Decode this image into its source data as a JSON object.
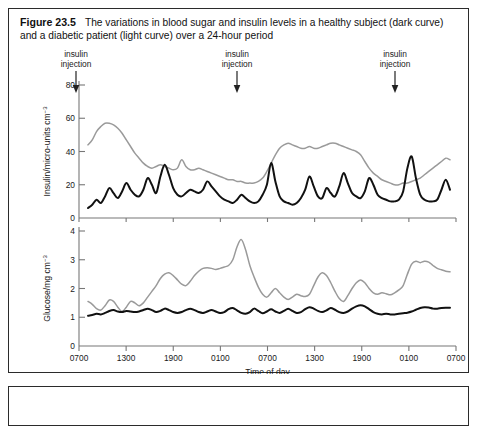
{
  "figure": {
    "number": "Figure 23.5",
    "caption": "The variations in blood sugar and insulin levels in a healthy subject (dark curve) and a diabetic patient (light curve) over a 24-hour period"
  },
  "annotations": {
    "injection_line1": "insulin",
    "injection_line2": "injection",
    "arrow_icon": "down-arrow-icon",
    "positions": [
      75,
      236,
      394
    ]
  },
  "colors": {
    "healthy_curve": "#111111",
    "diabetic_curve": "#9a9a9a",
    "axis": "#777777",
    "border": "#2b2b2b",
    "text": "#1a1a1a"
  },
  "chart_data": [
    {
      "type": "line",
      "title": "Insulin levels over 24 hours",
      "xlabel": "Time of day",
      "ylabel": "Insulin/micro-units cm−3",
      "ylim": [
        0,
        80
      ],
      "yticks": [
        0,
        20,
        40,
        60,
        80
      ],
      "ytick_labels": [
        "0",
        "20",
        "40",
        "60",
        "80"
      ],
      "xtick_labels": [
        "0700",
        "1300",
        "1900",
        "0100",
        "0700",
        "1300",
        "1900",
        "0100",
        "0700"
      ],
      "grid": false,
      "legend": "none",
      "series": [
        {
          "name": "diabetic patient (light curve)",
          "color": "#9a9a9a",
          "values": [
            44,
            47,
            52,
            55,
            57,
            57,
            56,
            54,
            51,
            47,
            43,
            39,
            36,
            33,
            31,
            30,
            31,
            32,
            31,
            30,
            29,
            30,
            35,
            31,
            29,
            29,
            30,
            29,
            28,
            27,
            26,
            25,
            24,
            23,
            23,
            22,
            22,
            21,
            21,
            21,
            22,
            24,
            28,
            33,
            38,
            42,
            44,
            45,
            44,
            43,
            42,
            42,
            43,
            42,
            42,
            43,
            44,
            45,
            45,
            44,
            43,
            42,
            41,
            40,
            38,
            34,
            30,
            27,
            25,
            23,
            22,
            21,
            20,
            20,
            21,
            21,
            22,
            23,
            24,
            26,
            28,
            30,
            32,
            34,
            36,
            35
          ]
        },
        {
          "name": "healthy subject (dark curve)",
          "color": "#111111",
          "values": [
            6,
            8,
            11,
            9,
            13,
            18,
            15,
            12,
            16,
            21,
            17,
            14,
            13,
            17,
            24,
            20,
            15,
            25,
            32,
            26,
            18,
            14,
            13,
            15,
            17,
            16,
            15,
            17,
            22,
            19,
            16,
            13,
            11,
            10,
            9,
            11,
            14,
            12,
            10,
            9,
            10,
            14,
            20,
            33,
            22,
            13,
            10,
            9,
            8,
            9,
            12,
            17,
            25,
            19,
            13,
            12,
            18,
            15,
            13,
            19,
            27,
            21,
            15,
            13,
            12,
            16,
            24,
            20,
            14,
            12,
            11,
            10,
            10,
            11,
            16,
            30,
            37,
            24,
            14,
            11,
            10,
            10,
            11,
            17,
            23,
            17
          ]
        }
      ]
    },
    {
      "type": "line",
      "title": "Blood glucose levels over 24 hours",
      "xlabel": "Time of day",
      "ylabel": "Glucose/mg cm−3",
      "ylim": [
        0,
        4
      ],
      "yticks": [
        0,
        1,
        2,
        3,
        4
      ],
      "ytick_labels": [
        "0",
        "1",
        "2",
        "3",
        "4"
      ],
      "xtick_labels": [
        "0700",
        "1300",
        "1900",
        "0100",
        "0700",
        "1300",
        "1900",
        "0100",
        "0700"
      ],
      "grid": false,
      "legend": "none",
      "series": [
        {
          "name": "diabetic patient (light curve)",
          "color": "#9a9a9a",
          "values": [
            1.55,
            1.45,
            1.3,
            1.25,
            1.4,
            1.6,
            1.55,
            1.35,
            1.2,
            1.35,
            1.55,
            1.5,
            1.4,
            1.5,
            1.7,
            1.9,
            2.1,
            2.35,
            2.5,
            2.55,
            2.45,
            2.3,
            2.15,
            2.1,
            2.25,
            2.45,
            2.6,
            2.7,
            2.72,
            2.7,
            2.66,
            2.7,
            2.75,
            2.8,
            3.0,
            3.45,
            3.7,
            3.35,
            2.8,
            2.4,
            2.05,
            1.8,
            1.7,
            1.85,
            2.0,
            1.85,
            1.7,
            1.62,
            1.7,
            1.8,
            1.75,
            1.72,
            1.8,
            2.1,
            2.4,
            2.55,
            2.45,
            2.2,
            1.9,
            1.65,
            1.55,
            1.75,
            2.0,
            2.2,
            2.3,
            2.2,
            2.0,
            1.85,
            1.8,
            1.85,
            1.82,
            1.78,
            1.85,
            1.95,
            2.1,
            2.5,
            2.85,
            2.95,
            2.9,
            2.95,
            2.92,
            2.8,
            2.7,
            2.65,
            2.6,
            2.58
          ]
        },
        {
          "name": "healthy subject (dark curve)",
          "color": "#111111",
          "values": [
            1.05,
            1.08,
            1.12,
            1.1,
            1.15,
            1.22,
            1.25,
            1.2,
            1.18,
            1.22,
            1.2,
            1.18,
            1.2,
            1.25,
            1.3,
            1.25,
            1.18,
            1.22,
            1.3,
            1.25,
            1.18,
            1.15,
            1.18,
            1.25,
            1.3,
            1.25,
            1.18,
            1.15,
            1.2,
            1.25,
            1.2,
            1.15,
            1.18,
            1.28,
            1.32,
            1.24,
            1.15,
            1.12,
            1.18,
            1.3,
            1.22,
            1.14,
            1.2,
            1.28,
            1.2,
            1.15,
            1.22,
            1.3,
            1.22,
            1.15,
            1.18,
            1.28,
            1.35,
            1.3,
            1.22,
            1.18,
            1.24,
            1.32,
            1.26,
            1.18,
            1.15,
            1.2,
            1.3,
            1.38,
            1.42,
            1.38,
            1.28,
            1.18,
            1.12,
            1.1,
            1.12,
            1.1,
            1.1,
            1.12,
            1.14,
            1.16,
            1.2,
            1.26,
            1.32,
            1.35,
            1.34,
            1.3,
            1.3,
            1.32,
            1.33,
            1.33
          ]
        }
      ]
    }
  ]
}
